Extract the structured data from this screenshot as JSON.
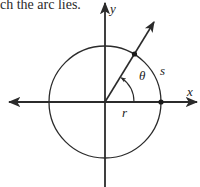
{
  "caption": "ch the arc lies.",
  "diagram": {
    "type": "unit-circle-arc",
    "labels": {
      "x_axis": "x",
      "y_axis": "y",
      "angle": "θ",
      "arc": "s",
      "radius": "r"
    },
    "colors": {
      "stroke": "#2b2b2b",
      "background": "#ffffff"
    }
  }
}
